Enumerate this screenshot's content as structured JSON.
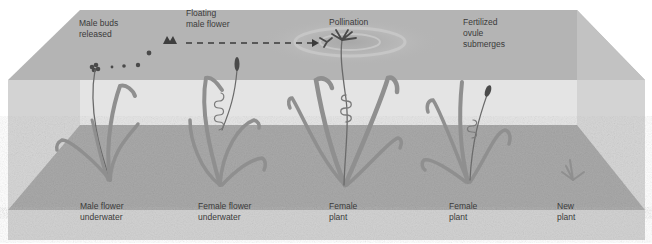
{
  "diagram": {
    "top_labels": [
      {
        "id": "male-buds-released",
        "text": "Male buds\nreleased"
      },
      {
        "id": "floating-male-flower",
        "text": "Floating\nmale flower"
      },
      {
        "id": "pollination",
        "text": "Pollination"
      },
      {
        "id": "fertilized-ovule-submerges",
        "text": "Fertilized\novule\nsubmerges"
      }
    ],
    "bottom_labels": [
      {
        "id": "male-flower-underwater",
        "text": "Male flower\nunderwater"
      },
      {
        "id": "female-flower-underwater",
        "text": "Female flower\nunderwater"
      },
      {
        "id": "female-plant-1",
        "text": "Female\nplant"
      },
      {
        "id": "female-plant-2",
        "text": "Female\nplant"
      },
      {
        "id": "new-plant",
        "text": "New\nplant"
      }
    ],
    "colors": {
      "water_surface": "#b4b4b4",
      "water_body": "#dcdcdc",
      "sediment": "#a9a9a9",
      "front_sand": "#d2d2d2",
      "plant": "#8f8f8f",
      "plant_dark": "#5a5a5a",
      "text": "#3a3a3a"
    }
  }
}
